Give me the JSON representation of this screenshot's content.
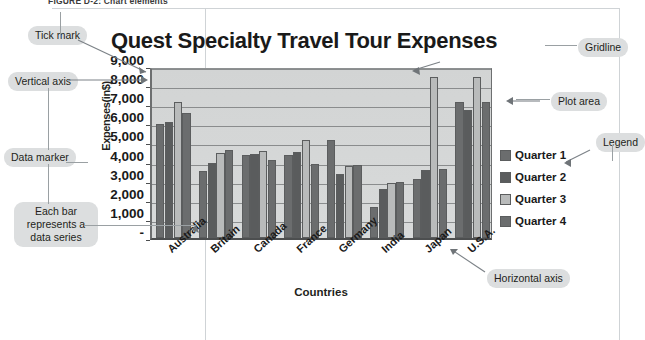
{
  "figure": {
    "caption": "FIGURE D-2: Chart elements"
  },
  "chart_data": {
    "type": "bar",
    "title": "Quest Specialty Travel Tour Expenses",
    "xlabel": "Countries",
    "ylabel": "Expenses(in$)",
    "categories": [
      "Australia",
      "Britain",
      "Canada",
      "France",
      "Germany",
      "India",
      "Japan",
      "U.S.A."
    ],
    "ylim": [
      0,
      9000
    ],
    "ytick_labels": [
      "-",
      "1,000",
      "2,000",
      "3,000",
      "4,000",
      "5,000",
      "6,000",
      "7,000",
      "8,000",
      "9,000"
    ],
    "grid": true,
    "legend_position": "right",
    "series": [
      {
        "name": "Quarter 1",
        "color": "#6b6d6e",
        "values": [
          5950,
          3500,
          4350,
          4350,
          5150,
          1600,
          3100,
          7100
        ]
      },
      {
        "name": "Quarter 2",
        "color": "#5a5c5d",
        "values": [
          6050,
          3950,
          4400,
          4500,
          3350,
          2550,
          3550,
          6700
        ]
      },
      {
        "name": "Quarter 3",
        "color": "#b9bbbb",
        "values": [
          7100,
          4450,
          4550,
          5150,
          3750,
          2900,
          8450,
          8400
        ]
      },
      {
        "name": "Quarter 4",
        "color": "#6b6d6e",
        "values": [
          6550,
          4600,
          4100,
          3850,
          3800,
          2950,
          3600,
          7100
        ]
      }
    ]
  },
  "callouts": {
    "tick_mark": "Tick mark",
    "vertical_axis": "Vertical axis",
    "data_marker": "Data marker",
    "each_bar": "Each bar represents a data series",
    "gridline": "Gridline",
    "plot_area": "Plot area",
    "legend": "Legend",
    "horizontal_axis": "Horizontal axis"
  }
}
